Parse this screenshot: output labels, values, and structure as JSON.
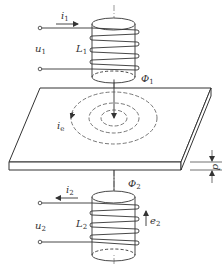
{
  "diagram": {
    "type": "eddy-current-transmission-sensor",
    "colors": {
      "stroke": "#333333",
      "background": "#ffffff"
    },
    "top_coil": {
      "current_label": "i",
      "current_sub": "1",
      "voltage_label": "u",
      "voltage_sub": "1",
      "inductance_label": "L",
      "inductance_sub": "1",
      "flux_label": "Φ",
      "flux_sub": "1"
    },
    "plate": {
      "eddy_current_label": "i",
      "eddy_current_sub": "e",
      "thickness_label": "d"
    },
    "bottom_coil": {
      "current_label": "i",
      "current_sub": "2",
      "voltage_label": "u",
      "voltage_sub": "2",
      "inductance_label": "L",
      "inductance_sub": "2",
      "flux_label": "Φ",
      "flux_sub": "2",
      "emf_label": "e",
      "emf_sub": "2"
    }
  }
}
